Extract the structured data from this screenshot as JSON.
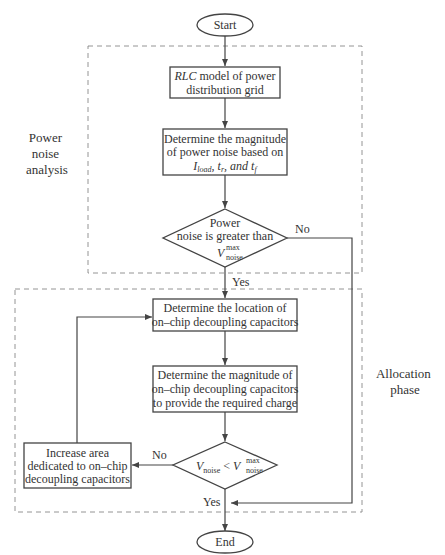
{
  "diagram": {
    "type": "flowchart",
    "start_label": "Start",
    "end_label": "End",
    "regions": [
      {
        "id": "power-noise-analysis",
        "label_lines": [
          "Power",
          "noise",
          "analysis"
        ]
      },
      {
        "id": "allocation-phase",
        "label_lines": [
          "Allocation",
          "phase"
        ]
      }
    ],
    "nodes": {
      "rlc_model": {
        "line1_italic": "RLC",
        "line1_rest": " model of power",
        "line2": "distribution grid"
      },
      "determine_noise": {
        "line1": "Determine the magnitude",
        "line2": "of power noise based on",
        "line3_parts": [
          "I",
          "load",
          ",  t",
          "r",
          ",  and  t",
          "f"
        ]
      },
      "decision_noise": {
        "line1": "Power",
        "line2": "noise is greater than",
        "line3_main": "V",
        "line3_sup": "max",
        "line3_sub": "noise"
      },
      "determine_location": {
        "line1": "Determine the location of",
        "line2": "on–chip decoupling capacitors"
      },
      "determine_magnitude": {
        "line1": "Determine the magnitude of",
        "line2": "on–chip decoupling capacitors",
        "line3": "to provide the required charge"
      },
      "decision_compare": {
        "lhs_main": "V",
        "lhs_sub": "noise",
        "op": "<",
        "rhs_main": "V",
        "rhs_sup": "max",
        "rhs_sub": "noise"
      },
      "increase_area": {
        "line1": "Increase area",
        "line2": "dedicated to on–chip",
        "line3": "decoupling capacitors"
      }
    },
    "edge_labels": {
      "noise_no": "No",
      "noise_yes": "Yes",
      "compare_no": "No",
      "compare_yes": "Yes"
    }
  }
}
